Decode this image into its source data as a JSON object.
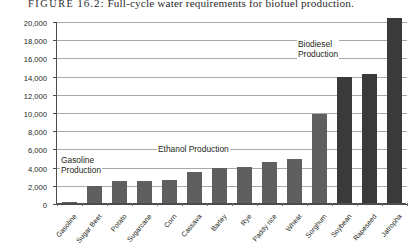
{
  "figure": {
    "label": "FIGURE",
    "number": "16.2:",
    "caption": "Full-cycle water requirements for biofuel production."
  },
  "chart_data": {
    "type": "bar",
    "title": "Full-cycle water requirements for biofuel production.",
    "xlabel": "",
    "ylabel": "Gallons of Water per Gallon of Output",
    "ylim": [
      0,
      20000
    ],
    "ytick_step": 2000,
    "ytick_labels": [
      "0",
      "2,000",
      "4,000",
      "6,000",
      "8,000",
      "10,000",
      "12,000",
      "14,000",
      "16,000",
      "18,000",
      "20,000"
    ],
    "grid": true,
    "legend": "none",
    "categories": [
      "Gasoline",
      "Sugar Beet",
      "Potato",
      "Sugarcane",
      "Corn",
      "Cassava",
      "Barley",
      "Rye",
      "Paddy rice",
      "Wheat",
      "Sorghum",
      "Soybean",
      "Rapeseed",
      "Jatropha"
    ],
    "values": [
      150,
      1900,
      2400,
      2450,
      2550,
      3450,
      3850,
      4000,
      4500,
      4800,
      9800,
      13900,
      14200,
      20300
    ],
    "bar_colors": [
      "#5f5f5f",
      "#5f5f5f",
      "#5f5f5f",
      "#5f5f5f",
      "#5f5f5f",
      "#5f5f5f",
      "#5f5f5f",
      "#5f5f5f",
      "#5f5f5f",
      "#5f5f5f",
      "#5f5f5f",
      "#3a3a3a",
      "#3a3a3a",
      "#3a3a3a"
    ],
    "annotations": [
      {
        "text": "Gasoline\nProduction",
        "line1": "Gasoline",
        "line2": "Production",
        "categories": [
          "Gasoline"
        ]
      },
      {
        "text": "Ethanol Production",
        "line1": "Ethanol Production",
        "line2": "",
        "categories": [
          "Sugar Beet",
          "Potato",
          "Sugarcane",
          "Corn",
          "Cassava",
          "Barley",
          "Rye",
          "Paddy rice",
          "Wheat",
          "Sorghum"
        ]
      },
      {
        "text": "Biodiesel\nProduction",
        "line1": "Biodiesel",
        "line2": "Production",
        "categories": [
          "Soybean",
          "Rapeseed",
          "Jatropha"
        ]
      }
    ]
  },
  "axis": {
    "y_title": "Gallons of Water per Gallon of Output"
  }
}
